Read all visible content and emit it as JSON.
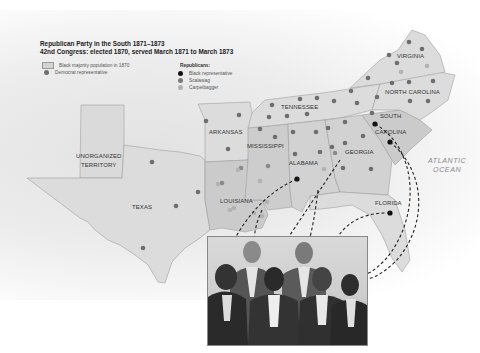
{
  "legend": {
    "title_line1": "Republican Party in the South 1871–1873",
    "title_line2": "42nd Congress: elected 1870, served March 1871 to March 1873",
    "black_majority_label": "Black majority population in 1870",
    "democrat_label": "Democrat representative",
    "republicans_header": "Republicans:",
    "black_rep_label": "Black representative",
    "scalawag_label": "Scalawag",
    "carpetbagger_label": "Carpetbagger"
  },
  "colors": {
    "democrat": "#6e6e6e",
    "black_rep": "#111111",
    "scalawag": "#7a7a7a",
    "carpetbagger": "#b0b0b0",
    "state_fill": "#dcdcdc",
    "black_majority_fill": "#c9c9c9"
  },
  "states": {
    "virginia": "VIRGINIA",
    "north_carolina": "NORTH CAROLINA",
    "tennessee": "TENNESSEE",
    "south_carolina_1": "SOUTH",
    "south_carolina_2": "CAROLINA",
    "arkansas": "ARKANSAS",
    "mississippi": "MISSISSIPPI",
    "alabama": "ALABAMA",
    "georgia": "GEORGIA",
    "louisiana": "LOUISIANA",
    "texas": "TEXAS",
    "florida": "FLORIDA",
    "unorganized_1": "UNORGANIZED",
    "unorganized_2": "TERRITORY"
  },
  "ocean": {
    "line1": "ATLANTIC",
    "line2": "OCEAN"
  },
  "photo": {
    "subject_count": 6,
    "description": "Engraved group portrait of six Black representatives"
  }
}
